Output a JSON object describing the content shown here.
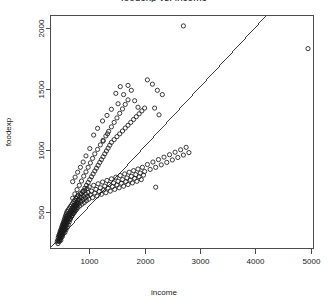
{
  "chart_data": {
    "type": "scatter",
    "title": "foodexp vs. income",
    "xlabel": "income",
    "ylabel": "foodexp",
    "xlim": [
      300,
      5050
    ],
    "ylim": [
      200,
      2100
    ],
    "xticks": [
      1000,
      2000,
      3000,
      4000,
      5000
    ],
    "yticks": [
      500,
      1000,
      1500,
      2000
    ],
    "grid": false,
    "legend": null,
    "marker": "open-circle",
    "marker_color": "#1a1a1a",
    "fit_line": {
      "type": "linear-regression",
      "color": "#2b2b2b",
      "x_start": 320,
      "y_start": 215,
      "x_end": 4210,
      "y_end": 2105
    },
    "points": [
      [
        420,
        255
      ],
      [
        430,
        268
      ],
      [
        435,
        240
      ],
      [
        440,
        290
      ],
      [
        445,
        262
      ],
      [
        450,
        305
      ],
      [
        455,
        280
      ],
      [
        460,
        315
      ],
      [
        462,
        258
      ],
      [
        465,
        295
      ],
      [
        470,
        330
      ],
      [
        472,
        272
      ],
      [
        475,
        310
      ],
      [
        478,
        285
      ],
      [
        480,
        345
      ],
      [
        482,
        300
      ],
      [
        485,
        325
      ],
      [
        488,
        268
      ],
      [
        490,
        355
      ],
      [
        492,
        312
      ],
      [
        495,
        290
      ],
      [
        498,
        335
      ],
      [
        500,
        370
      ],
      [
        502,
        305
      ],
      [
        505,
        348
      ],
      [
        508,
        318
      ],
      [
        510,
        385
      ],
      [
        512,
        330
      ],
      [
        515,
        360
      ],
      [
        518,
        300
      ],
      [
        520,
        395
      ],
      [
        522,
        342
      ],
      [
        525,
        372
      ],
      [
        528,
        320
      ],
      [
        530,
        408
      ],
      [
        532,
        355
      ],
      [
        535,
        385
      ],
      [
        538,
        335
      ],
      [
        540,
        420
      ],
      [
        542,
        368
      ],
      [
        545,
        398
      ],
      [
        548,
        348
      ],
      [
        550,
        435
      ],
      [
        552,
        380
      ],
      [
        555,
        410
      ],
      [
        558,
        360
      ],
      [
        560,
        448
      ],
      [
        562,
        392
      ],
      [
        565,
        422
      ],
      [
        568,
        372
      ],
      [
        570,
        462
      ],
      [
        572,
        405
      ],
      [
        575,
        435
      ],
      [
        578,
        385
      ],
      [
        580,
        475
      ],
      [
        582,
        418
      ],
      [
        585,
        448
      ],
      [
        588,
        398
      ],
      [
        590,
        488
      ],
      [
        592,
        430
      ],
      [
        595,
        460
      ],
      [
        598,
        410
      ],
      [
        600,
        502
      ],
      [
        605,
        442
      ],
      [
        610,
        472
      ],
      [
        615,
        422
      ],
      [
        620,
        515
      ],
      [
        625,
        455
      ],
      [
        630,
        485
      ],
      [
        635,
        435
      ],
      [
        640,
        528
      ],
      [
        645,
        468
      ],
      [
        650,
        498
      ],
      [
        655,
        448
      ],
      [
        660,
        542
      ],
      [
        665,
        480
      ],
      [
        670,
        512
      ],
      [
        675,
        460
      ],
      [
        680,
        555
      ],
      [
        685,
        492
      ],
      [
        690,
        525
      ],
      [
        695,
        472
      ],
      [
        700,
        568
      ],
      [
        705,
        505
      ],
      [
        710,
        538
      ],
      [
        715,
        485
      ],
      [
        720,
        582
      ],
      [
        725,
        518
      ],
      [
        730,
        550
      ],
      [
        735,
        498
      ],
      [
        740,
        595
      ],
      [
        745,
        530
      ],
      [
        750,
        562
      ],
      [
        755,
        510
      ],
      [
        760,
        608
      ],
      [
        765,
        545
      ],
      [
        770,
        575
      ],
      [
        775,
        522
      ],
      [
        780,
        622
      ],
      [
        785,
        558
      ],
      [
        790,
        588
      ],
      [
        795,
        535
      ],
      [
        800,
        635
      ],
      [
        810,
        570
      ],
      [
        820,
        600
      ],
      [
        830,
        548
      ],
      [
        840,
        648
      ],
      [
        850,
        585
      ],
      [
        860,
        615
      ],
      [
        870,
        562
      ],
      [
        880,
        662
      ],
      [
        890,
        598
      ],
      [
        900,
        628
      ],
      [
        910,
        575
      ],
      [
        920,
        675
      ],
      [
        930,
        612
      ],
      [
        940,
        642
      ],
      [
        950,
        590
      ],
      [
        960,
        688
      ],
      [
        970,
        625
      ],
      [
        980,
        655
      ],
      [
        990,
        602
      ],
      [
        1000,
        702
      ],
      [
        1020,
        638
      ],
      [
        1040,
        668
      ],
      [
        1060,
        615
      ],
      [
        1080,
        715
      ],
      [
        1100,
        652
      ],
      [
        1120,
        682
      ],
      [
        1140,
        628
      ],
      [
        1160,
        728
      ],
      [
        1180,
        665
      ],
      [
        1200,
        695
      ],
      [
        1220,
        642
      ],
      [
        1240,
        742
      ],
      [
        1260,
        678
      ],
      [
        1280,
        708
      ],
      [
        1300,
        655
      ],
      [
        1320,
        755
      ],
      [
        1340,
        692
      ],
      [
        1360,
        722
      ],
      [
        1380,
        668
      ],
      [
        1400,
        768
      ],
      [
        1420,
        705
      ],
      [
        1440,
        735
      ],
      [
        1460,
        682
      ],
      [
        1480,
        782
      ],
      [
        1500,
        718
      ],
      [
        1520,
        748
      ],
      [
        1540,
        695
      ],
      [
        1560,
        795
      ],
      [
        1580,
        732
      ],
      [
        1600,
        762
      ],
      [
        1620,
        708
      ],
      [
        1640,
        808
      ],
      [
        1660,
        745
      ],
      [
        1680,
        775
      ],
      [
        1700,
        722
      ],
      [
        1720,
        822
      ],
      [
        1740,
        758
      ],
      [
        1760,
        788
      ],
      [
        1780,
        735
      ],
      [
        1800,
        835
      ],
      [
        1820,
        772
      ],
      [
        1840,
        802
      ],
      [
        1860,
        748
      ],
      [
        1880,
        848
      ],
      [
        1900,
        785
      ],
      [
        1920,
        815
      ],
      [
        1940,
        762
      ],
      [
        1960,
        862
      ],
      [
        1980,
        798
      ],
      [
        2000,
        828
      ],
      [
        2050,
        885
      ],
      [
        2100,
        845
      ],
      [
        2150,
        905
      ],
      [
        2200,
        862
      ],
      [
        2250,
        925
      ],
      [
        2300,
        882
      ],
      [
        2350,
        945
      ],
      [
        2400,
        902
      ],
      [
        2450,
        965
      ],
      [
        2500,
        922
      ],
      [
        2550,
        985
      ],
      [
        2600,
        942
      ],
      [
        2650,
        1005
      ],
      [
        2700,
        962
      ],
      [
        2750,
        1025
      ],
      [
        2800,
        982
      ],
      [
        560,
        330
      ],
      [
        580,
        352
      ],
      [
        600,
        372
      ],
      [
        620,
        395
      ],
      [
        640,
        418
      ],
      [
        660,
        440
      ],
      [
        680,
        462
      ],
      [
        700,
        485
      ],
      [
        720,
        508
      ],
      [
        740,
        530
      ],
      [
        760,
        552
      ],
      [
        780,
        575
      ],
      [
        800,
        598
      ],
      [
        830,
        620
      ],
      [
        860,
        645
      ],
      [
        890,
        668
      ],
      [
        920,
        692
      ],
      [
        950,
        715
      ],
      [
        980,
        738
      ],
      [
        1010,
        762
      ],
      [
        1040,
        785
      ],
      [
        1070,
        808
      ],
      [
        1100,
        832
      ],
      [
        1130,
        855
      ],
      [
        1160,
        878
      ],
      [
        1190,
        902
      ],
      [
        1220,
        925
      ],
      [
        1250,
        948
      ],
      [
        1280,
        972
      ],
      [
        1310,
        995
      ],
      [
        1340,
        1018
      ],
      [
        1370,
        1042
      ],
      [
        1400,
        1065
      ],
      [
        1450,
        1088
      ],
      [
        1500,
        1112
      ],
      [
        1550,
        1135
      ],
      [
        1600,
        1158
      ],
      [
        1650,
        1182
      ],
      [
        1700,
        1205
      ],
      [
        1750,
        1228
      ],
      [
        1800,
        1252
      ],
      [
        1850,
        1275
      ],
      [
        1900,
        1298
      ],
      [
        1950,
        1322
      ],
      [
        2000,
        1345
      ],
      [
        700,
        610
      ],
      [
        740,
        645
      ],
      [
        780,
        680
      ],
      [
        820,
        715
      ],
      [
        860,
        750
      ],
      [
        900,
        790
      ],
      [
        940,
        825
      ],
      [
        980,
        862
      ],
      [
        1020,
        898
      ],
      [
        1060,
        935
      ],
      [
        1100,
        972
      ],
      [
        1150,
        1008
      ],
      [
        1200,
        1045
      ],
      [
        1250,
        1082
      ],
      [
        1300,
        1118
      ],
      [
        1350,
        1155
      ],
      [
        1400,
        1192
      ],
      [
        1450,
        1228
      ],
      [
        1500,
        1265
      ],
      [
        1550,
        1302
      ],
      [
        1600,
        1338
      ],
      [
        1650,
        1375
      ],
      [
        1700,
        1412
      ],
      [
        1480,
        1465
      ],
      [
        1560,
        1520
      ],
      [
        1620,
        1455
      ],
      [
        1700,
        1530
      ],
      [
        1760,
        1490
      ],
      [
        1820,
        1405
      ],
      [
        1880,
        1352
      ],
      [
        1520,
        1380
      ],
      [
        1400,
        1335
      ],
      [
        1320,
        1285
      ],
      [
        1240,
        1240
      ],
      [
        2050,
        1575
      ],
      [
        2140,
        1540
      ],
      [
        2230,
        1490
      ],
      [
        2320,
        1455
      ],
      [
        2180,
        1345
      ],
      [
        2260,
        1290
      ],
      [
        2200,
        700
      ],
      [
        2700,
        2015
      ],
      [
        4950,
        1830
      ],
      [
        1150,
        1180
      ],
      [
        1080,
        1125
      ],
      [
        1250,
        1075
      ],
      [
        1330,
        1135
      ],
      [
        890,
        905
      ],
      [
        940,
        955
      ],
      [
        1010,
        1015
      ],
      [
        840,
        862
      ],
      [
        790,
        822
      ],
      [
        745,
        782
      ],
      [
        700,
        745
      ]
    ]
  }
}
